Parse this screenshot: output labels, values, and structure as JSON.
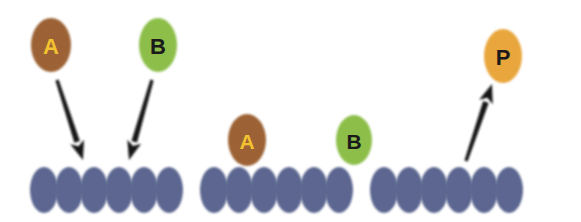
{
  "figure": {
    "background_color": "#ffffff",
    "width": 581,
    "height": 222
  },
  "colors": {
    "species_a_fill": "#9c6234",
    "species_a_text": "#f2c230",
    "species_b_fill": "#8cbe49",
    "species_b_text": "#1a1a1a",
    "product_p_fill": "#e8a63c",
    "product_p_text": "#1a1a1a",
    "surface_site_fill": "#5c6690",
    "arrow_color": "#151515",
    "bond_color": "#151515"
  },
  "panels": [
    {
      "id": "panel-adsorption",
      "caption": "",
      "molecules": [
        {
          "id": "a-gas",
          "label": "A",
          "cx": 51,
          "cy": 45,
          "rx": 20,
          "ry": 27,
          "fill_key": "species_a_fill",
          "text_key": "species_a_text",
          "font_size": 22
        },
        {
          "id": "b-gas",
          "label": "B",
          "cx": 158,
          "cy": 45,
          "rx": 19,
          "ry": 27,
          "fill_key": "species_b_fill",
          "text_key": "species_b_text",
          "font_size": 22
        }
      ],
      "arrows": [
        {
          "id": "arrow-a-adsorb",
          "x1": 57,
          "y1": 80,
          "x2": 83,
          "y2": 160,
          "direction": "down-right"
        },
        {
          "id": "arrow-b-adsorb",
          "x1": 152,
          "y1": 80,
          "x2": 129,
          "y2": 160,
          "direction": "down-left"
        }
      ],
      "bonds": [],
      "surface": {
        "id": "surface-1",
        "start_x": 44,
        "cy": 190,
        "rx": 14,
        "ry": 23,
        "spacing": 25,
        "count": 6
      }
    },
    {
      "id": "panel-surface-reaction",
      "caption": "",
      "molecules": [
        {
          "id": "a-adsorbed",
          "label": "A",
          "cx": 247,
          "cy": 140,
          "rx": 19,
          "ry": 26,
          "fill_key": "species_a_fill",
          "text_key": "species_a_text",
          "font_size": 21
        },
        {
          "id": "b-adsorbed",
          "label": "B",
          "cx": 354,
          "cy": 140,
          "rx": 18,
          "ry": 25,
          "fill_key": "species_b_fill",
          "text_key": "species_b_text",
          "font_size": 21
        }
      ],
      "arrows": [],
      "bonds": [
        {
          "id": "bond-a-b",
          "x1": 268,
          "y1": 141,
          "x2": 339,
          "y2": 141,
          "style": "dashed",
          "dash_pattern": "11 8",
          "width": 6
        }
      ],
      "surface": {
        "id": "surface-2",
        "start_x": 214,
        "cy": 190,
        "rx": 14,
        "ry": 23,
        "spacing": 25,
        "count": 6
      }
    },
    {
      "id": "panel-desorption",
      "caption": "",
      "molecules": [
        {
          "id": "p-product",
          "label": "P",
          "cx": 503,
          "cy": 56,
          "rx": 19,
          "ry": 27,
          "fill_key": "product_p_fill",
          "text_key": "product_p_text",
          "font_size": 22
        }
      ],
      "arrows": [
        {
          "id": "arrow-p-desorb",
          "x1": 466,
          "y1": 161,
          "x2": 492,
          "y2": 84,
          "direction": "up-right"
        }
      ],
      "bonds": [],
      "surface": {
        "id": "surface-3",
        "start_x": 384,
        "cy": 190,
        "rx": 14,
        "ry": 23,
        "spacing": 25,
        "count": 6
      }
    }
  ]
}
